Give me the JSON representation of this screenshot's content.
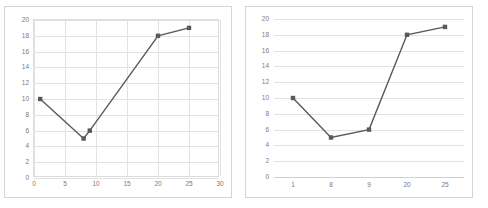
{
  "figure": {
    "background": "#ffffff",
    "panel_border_color": "#d4d4d4",
    "series_color": "#595959",
    "gridline_color": "#e2e2e2",
    "tick_label_color": "#7a7a7a"
  },
  "chart_data": [
    {
      "id": "left-chart",
      "type": "scatter",
      "title": "",
      "xlabel": "",
      "ylabel": "",
      "marker": "square",
      "line": true,
      "grid": {
        "horizontal": true,
        "vertical": true
      },
      "legend": "none",
      "xlim": [
        0,
        30
      ],
      "ylim": [
        0,
        20
      ],
      "xticks": [
        0,
        5,
        10,
        15,
        20,
        25,
        30
      ],
      "xtick_labels": [
        "0",
        "5",
        "10",
        "15",
        "20",
        "25",
        "30"
      ],
      "yticks": [
        0,
        2,
        4,
        6,
        8,
        10,
        12,
        14,
        16,
        18,
        20
      ],
      "ytick_labels": [
        "0",
        "2",
        "4",
        "6",
        "8",
        "10",
        "12",
        "14",
        "16",
        "18",
        "20"
      ],
      "x": [
        1,
        8,
        9,
        20,
        25
      ],
      "y": [
        10,
        5,
        6,
        18,
        19
      ],
      "points": [
        {
          "x": 1,
          "y": 10
        },
        {
          "x": 8,
          "y": 5
        },
        {
          "x": 9,
          "y": 6
        },
        {
          "x": 20,
          "y": 18
        },
        {
          "x": 25,
          "y": 19
        }
      ]
    },
    {
      "id": "right-chart",
      "type": "line",
      "title": "",
      "xlabel": "",
      "ylabel": "",
      "marker": "square",
      "line": true,
      "grid": {
        "horizontal": true,
        "vertical": false
      },
      "legend": "none",
      "ylim": [
        0,
        20
      ],
      "categories": [
        "1",
        "8",
        "9",
        "20",
        "25"
      ],
      "values": [
        10,
        5,
        6,
        18,
        19
      ],
      "yticks": [
        0,
        2,
        4,
        6,
        8,
        10,
        12,
        14,
        16,
        18,
        20
      ],
      "ytick_labels": [
        "0",
        "2",
        "4",
        "6",
        "8",
        "10",
        "12",
        "14",
        "16",
        "18",
        "20"
      ]
    }
  ]
}
